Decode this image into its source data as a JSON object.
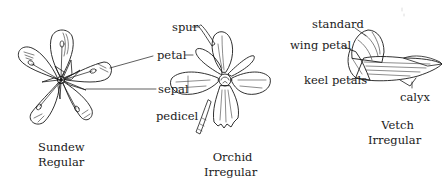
{
  "figure": {
    "flowers": [
      {
        "name": "Sundew",
        "symmetry": "Regular",
        "parts": []
      },
      {
        "name": "Orchid",
        "symmetry": "Irregular",
        "parts": [
          "spur",
          "petal",
          "sepal",
          "pedicel"
        ]
      },
      {
        "name": "Vetch",
        "symmetry": "Irregular",
        "parts": [
          "standard",
          "wing petal",
          "keel petals",
          "calyx"
        ]
      }
    ],
    "labels": {
      "spur": "spur",
      "petal": "petal",
      "sepal": "sepal",
      "pedicel": "pedicel",
      "standard": "standard",
      "wing_petal": "wing petal",
      "keel_petals": "keel petals",
      "calyx": "calyx"
    },
    "colors": {
      "ink": "#1a1a1a",
      "background": "#ffffff"
    }
  }
}
